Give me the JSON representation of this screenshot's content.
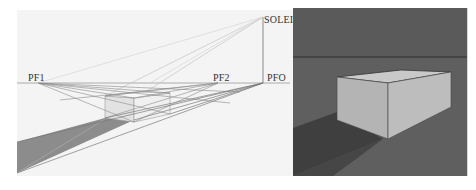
{
  "left_diagram": {
    "title": "Two-point perspective construction with sun shadow",
    "labels": {
      "pf1": "PF1",
      "pf2": "PF2",
      "pfo": "PFO",
      "soleil": "SOLEIL"
    },
    "colors": {
      "background": "#f4f4f4",
      "construction_lines": "#8a8a8a",
      "horizon_line": "#9a9a9a",
      "shadow": "#8c8c8c",
      "box_face_left": "#e2e2e2",
      "box_face_right": "#f0f0f0"
    }
  },
  "right_render": {
    "title": "Rendered box with cast shadow",
    "colors": {
      "background": "#5a5a5a",
      "horizon_line": "#2e2e2e",
      "box_top": "#c9c9c9",
      "box_left_face": "#b4b4b4",
      "box_right_face": "#bdbdbd",
      "shadow": "#3f3f3f"
    }
  }
}
